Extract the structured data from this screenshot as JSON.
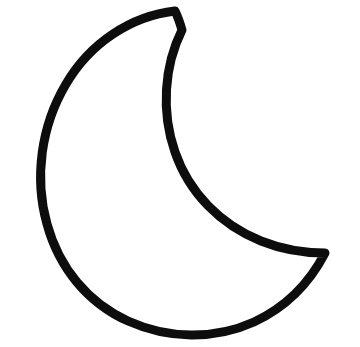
{
  "canvas": {
    "width": 360,
    "height": 347,
    "background_color": "#ffffff",
    "title": "Crescent Moon Outline"
  },
  "artwork": {
    "name": "crescent-moon",
    "description": "Hand-drawn crescent moon outline",
    "stroke_color": "#0d0d0d",
    "stroke_width": 9,
    "fill": "none",
    "stroke_linecap": "round",
    "stroke_linejoin": "round",
    "path": "M 175 11 C 131 16 90 43 66 84 C 41 126 34 178 47 224 C 59 268 88 303 128 321 C 168 339 214 340 254 322 C 284 308 309 284 325 253 C 303 253 281 249 261 241 C 221 225 189 193 175 152 C 161 112 164 66 182 30 C 180 23 178 17 175 11 Z",
    "outer_arc": {
      "leftmost_point": [
        38,
        176
      ],
      "bottom_point": [
        183,
        326
      ],
      "top_tip": [
        175,
        10
      ],
      "right_tip": [
        325,
        253
      ]
    },
    "inner_arc": {
      "leftmost_point": [
        143,
        140
      ],
      "passes_through": [
        [
          160,
          196
        ],
        [
          250,
          243
        ]
      ],
      "top_tip": [
        175,
        10
      ],
      "right_tip": [
        325,
        253
      ]
    }
  }
}
